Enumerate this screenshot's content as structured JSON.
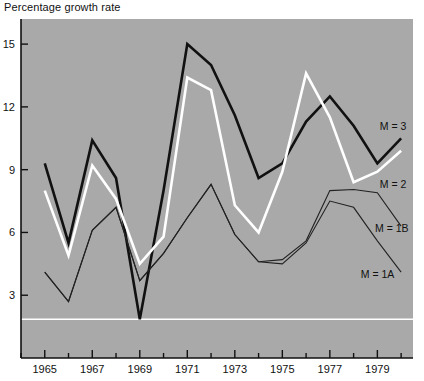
{
  "chart_data": {
    "type": "line",
    "title": "Percentage growth rate",
    "xlabel": "",
    "ylabel": "Percentage growth rate",
    "xlim": [
      1964,
      1980.5
    ],
    "ylim": [
      0,
      16.2
    ],
    "yticks": [
      "3",
      "6",
      "9",
      "12",
      "15"
    ],
    "ytick_values": [
      3,
      6,
      9,
      12,
      15
    ],
    "xticks": [
      "1965",
      "1967",
      "1969",
      "1971",
      "1973",
      "1975",
      "1977",
      "1979"
    ],
    "xtick_values": [
      1965,
      1967,
      1969,
      1971,
      1973,
      1975,
      1977,
      1979
    ],
    "minor_xticks": [
      1964,
      1966,
      1968,
      1970,
      1972,
      1974,
      1976,
      1978,
      1980
    ],
    "grid": false,
    "legend_position": "right-inline",
    "background": "#a9a9a9",
    "reference_line": {
      "value": 1.85,
      "color": "#ffffff"
    },
    "x": [
      1965,
      1966,
      1967,
      1968,
      1969,
      1970,
      1971,
      1972,
      1973,
      1974,
      1975,
      1976,
      1977,
      1978,
      1979,
      1980
    ],
    "series": [
      {
        "name": "M = 3",
        "label": "M = 3",
        "color": "#111111",
        "width": 2.6,
        "values": [
          9.3,
          5.5,
          10.4,
          8.6,
          1.85,
          8.0,
          15.0,
          14.0,
          11.6,
          8.6,
          9.3,
          11.3,
          12.5,
          11.1,
          9.3,
          10.5
        ]
      },
      {
        "name": "M = 2",
        "label": "M = 2",
        "color": "#ffffff",
        "width": 2.6,
        "values": [
          8.0,
          4.9,
          9.2,
          7.6,
          4.5,
          5.8,
          13.4,
          12.8,
          7.3,
          6.0,
          8.9,
          13.6,
          11.5,
          8.4,
          8.9,
          9.9
        ]
      },
      {
        "name": "M = 1B",
        "label": "M = 1B",
        "color": "#222222",
        "width": 1.1,
        "values": [
          4.1,
          2.7,
          6.1,
          7.2,
          3.7,
          5.0,
          6.7,
          8.3,
          5.9,
          4.6,
          4.7,
          5.6,
          8.0,
          8.05,
          7.9,
          6.3
        ]
      },
      {
        "name": "M = 1A",
        "label": "M = 1A",
        "color": "#222222",
        "width": 1.1,
        "values": [
          4.1,
          2.7,
          6.1,
          7.2,
          3.7,
          5.0,
          6.7,
          8.3,
          5.9,
          4.6,
          4.5,
          5.5,
          7.5,
          7.2,
          5.6,
          4.1
        ]
      }
    ],
    "series_label_positions": [
      {
        "label": "M = 3",
        "x": 1979.1,
        "y": 11.1
      },
      {
        "label": "M = 2",
        "x": 1979.1,
        "y": 8.3
      },
      {
        "label": "M = 1B",
        "x": 1978.9,
        "y": 6.2
      },
      {
        "label": "M = 1A",
        "x": 1978.3,
        "y": 4.0
      }
    ]
  }
}
